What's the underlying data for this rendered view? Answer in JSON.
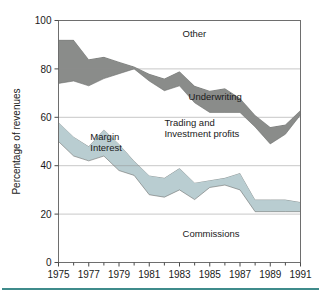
{
  "figure": {
    "background_color": "#ffffff",
    "rule_color": "#3f8b8b"
  },
  "chart_data": {
    "type": "area",
    "title": "",
    "subtitle": "",
    "xlabel": "",
    "ylabel": "Percentage of revenues",
    "xlim": [
      1975,
      1991
    ],
    "ylim": [
      0,
      100
    ],
    "grid": true,
    "legend_position": "inline-annotations",
    "x": [
      1975,
      1976,
      1977,
      1978,
      1979,
      1980,
      1981,
      1982,
      1983,
      1984,
      1985,
      1986,
      1987,
      1988,
      1989,
      1990,
      1991
    ],
    "xtick_labels": [
      "1975",
      "1977",
      "1979",
      "1981",
      "1983",
      "1985",
      "1987",
      "1989",
      "1991"
    ],
    "xtick_values": [
      1975,
      1977,
      1979,
      1981,
      1983,
      1985,
      1987,
      1989,
      1991
    ],
    "xminor_tick_values": [
      1976,
      1978,
      1980,
      1982,
      1984,
      1986,
      1988,
      1990
    ],
    "ytick_labels": [
      "0",
      "20",
      "40",
      "60",
      "80",
      "100"
    ],
    "ytick_values": [
      0,
      20,
      40,
      60,
      80,
      100
    ],
    "bands": [
      {
        "name": "Commissions",
        "label": "Commissions",
        "label_x": 1983.2,
        "label_y": 10.5,
        "fill": "#ffffff",
        "lower": [
          0,
          0,
          0,
          0,
          0,
          0,
          0,
          0,
          0,
          0,
          0,
          0,
          0,
          0,
          0,
          0,
          0
        ],
        "upper": [
          50,
          44,
          42,
          44,
          38,
          36,
          28,
          27,
          30,
          26,
          31,
          32,
          30,
          21,
          21,
          21,
          21
        ]
      },
      {
        "name": "Margin Interest",
        "label": "Margin\nInterest",
        "label_line1": "Margin",
        "label_line2": "Interest",
        "label_x": 1977.1,
        "label_y": 50.5,
        "fill": "#b9cdd1",
        "lower": [
          50,
          44,
          42,
          44,
          38,
          36,
          28,
          27,
          30,
          26,
          31,
          32,
          30,
          21,
          21,
          21,
          21
        ],
        "upper": [
          58,
          52,
          48,
          55,
          49,
          42,
          36,
          35,
          39,
          33,
          34,
          35,
          37,
          26,
          26,
          26,
          25
        ]
      },
      {
        "name": "Trading and Investment profits",
        "label_line1": "Trading and",
        "label_line2": "Investment profits",
        "label_x": 1982.0,
        "label_y": 56.5,
        "fill": "#ffffff",
        "lower": [
          58,
          52,
          48,
          55,
          49,
          42,
          36,
          35,
          39,
          33,
          34,
          35,
          37,
          26,
          26,
          26,
          25
        ],
        "upper": [
          74,
          75,
          73,
          76,
          78,
          80,
          75,
          71,
          73,
          66,
          62,
          62,
          62,
          56,
          49,
          53,
          61
        ]
      },
      {
        "name": "Underwriting",
        "label": "Underwriting",
        "label_x": 1983.6,
        "label_y": 67.0,
        "fill": "#8a8c8a",
        "lower": [
          74,
          75,
          73,
          76,
          78,
          80,
          75,
          71,
          73,
          66,
          62,
          62,
          62,
          56,
          49,
          53,
          61
        ],
        "upper": [
          92,
          92,
          84,
          85,
          83,
          81,
          78,
          76,
          79,
          73,
          71,
          72,
          68,
          61,
          56,
          57,
          63
        ]
      },
      {
        "name": "Other",
        "label": "Other",
        "label_x": 1983.2,
        "label_y": 93.0,
        "fill": "#ffffff",
        "lower": [
          92,
          92,
          84,
          85,
          83,
          81,
          78,
          76,
          79,
          73,
          71,
          72,
          68,
          61,
          56,
          57,
          63
        ],
        "upper": [
          100,
          100,
          100,
          100,
          100,
          100,
          100,
          100,
          100,
          100,
          100,
          100,
          100,
          100,
          100,
          100,
          100
        ]
      }
    ]
  }
}
